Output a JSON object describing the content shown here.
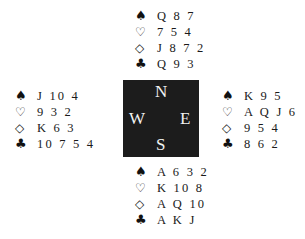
{
  "suits": {
    "spades": "♠",
    "hearts": "♡",
    "diamonds": "◇",
    "clubs": "♣"
  },
  "compass": {
    "north": "N",
    "south": "S",
    "west": "W",
    "east": "E",
    "background": "#1c1c1c"
  },
  "hands": {
    "north": {
      "spades": "Q 8 7",
      "hearts": "7 5 4",
      "diamonds": "J 8 7 2",
      "clubs": "Q 9 3"
    },
    "west": {
      "spades": "J 10 4",
      "hearts": "9 3 2",
      "diamonds": "K 6 3",
      "clubs": "10 7 5 4"
    },
    "east": {
      "spades": "K 9 5",
      "hearts": "A Q J 6",
      "diamonds": "9 5 4",
      "clubs": "8 6 2"
    },
    "south": {
      "spades": "A 6 3 2",
      "hearts": "K 10 8",
      "diamonds": "A Q 10",
      "clubs": "A K J"
    }
  }
}
